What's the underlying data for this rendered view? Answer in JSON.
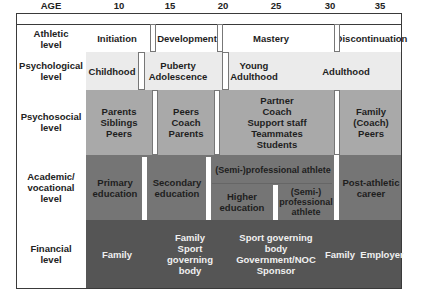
{
  "header": {
    "age_label": "AGE",
    "ages": [
      "10",
      "15",
      "20",
      "25",
      "30",
      "35"
    ]
  },
  "colors": {
    "athletic_bg": "#ffffff",
    "psychological_bg": "#ebebeb",
    "psychosocial_bg": "#a9a9a9",
    "academic_bg": "#757575",
    "financial_bg": "#555555",
    "border": "#3a3a3a"
  },
  "rows": {
    "athletic": {
      "label": "Athletic\nlevel",
      "stages": [
        "Initiation",
        "Development",
        "Mastery",
        "Discontinuation"
      ]
    },
    "psychological": {
      "label": "Psychological\nlevel",
      "stages": [
        "Childhood",
        "Puberty\nAdolescence",
        "Young\nAdulthood",
        "Adulthood"
      ]
    },
    "psychosocial": {
      "label": "Psychosocial\nlevel",
      "stages": [
        "Parents\nSiblings\nPeers",
        "Peers\nCoach\nParents",
        "Partner\nCoach\nSupport staff\nTeammates\nStudents",
        "Family\n(Coach)\nPeers"
      ]
    },
    "academic": {
      "label": "Academic/\nvocational\nlevel",
      "stages": [
        "Primary\neducation",
        "Secondary\neducation",
        "(Semi-)professional athlete",
        "Higher\neducation",
        "(Semi-)\nprofessional\nathlete",
        "Post-athletic\ncareer"
      ]
    },
    "financial": {
      "label": "Financial\nlevel",
      "stages": [
        "Family",
        "Family\nSport\ngoverning\nbody",
        "Sport governing\nbody\nGovernment/NOC\nSponsor",
        "Family",
        "Employer"
      ]
    }
  }
}
